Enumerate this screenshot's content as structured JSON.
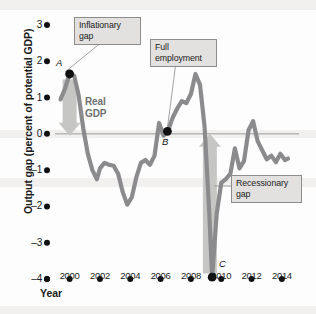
{
  "chart_data": {
    "type": "line",
    "title": "",
    "xlabel": "Year",
    "ylabel": "Output gap (percent of potential GDP)",
    "xlim": [
      1999.3,
      2014.6
    ],
    "ylim": [
      -4,
      3
    ],
    "grid": false,
    "zero_line": true,
    "legend": "none",
    "series_name": "Real GDP",
    "xticks": [
      2000,
      2002,
      2004,
      2006,
      2008,
      2010,
      2012,
      2014
    ],
    "xtick_labels": [
      "2000",
      "2002",
      "2004",
      "2006",
      "2008",
      "2010",
      "2012",
      "2014"
    ],
    "yticks": [
      3,
      2,
      1,
      0,
      -1,
      -2,
      -3,
      -4
    ],
    "ytick_labels": [
      "3",
      "2",
      "1",
      "0",
      "–1",
      "–2",
      "–3",
      "–4"
    ],
    "x": [
      1999.4,
      1999.7,
      2000.0,
      2000.3,
      2000.6,
      2000.9,
      2001.2,
      2001.5,
      2001.8,
      2002.0,
      2002.3,
      2002.6,
      2002.9,
      2003.2,
      2003.5,
      2003.8,
      2004.1,
      2004.4,
      2004.7,
      2005.0,
      2005.3,
      2005.6,
      2005.9,
      2006.2,
      2006.5,
      2006.8,
      2007.1,
      2007.4,
      2007.7,
      2008.0,
      2008.3,
      2008.6,
      2008.9,
      2009.2,
      2009.4,
      2009.7,
      2010.0,
      2010.3,
      2010.6,
      2010.9,
      2011.2,
      2011.5,
      2011.8,
      2012.1,
      2012.4,
      2012.7,
      2013.0,
      2013.3,
      2013.6,
      2013.9,
      2014.2,
      2014.4
    ],
    "y": [
      0.95,
      1.25,
      1.65,
      1.6,
      1.05,
      0.15,
      -0.55,
      -1.0,
      -1.25,
      -0.95,
      -0.8,
      -0.85,
      -0.88,
      -1.1,
      -1.6,
      -1.95,
      -1.75,
      -1.2,
      -0.8,
      -0.72,
      -0.85,
      -0.6,
      0.3,
      -0.05,
      0.1,
      0.45,
      0.7,
      0.9,
      0.85,
      1.1,
      1.65,
      1.35,
      0.2,
      -2.1,
      -3.95,
      -2.2,
      -1.35,
      -1.25,
      -1.1,
      -0.4,
      -0.95,
      -0.75,
      0.1,
      0.35,
      -0.2,
      -0.45,
      -0.7,
      -0.6,
      -0.78,
      -0.55,
      -0.72,
      -0.68
    ],
    "points": [
      {
        "label": "A",
        "x": 2000.0,
        "y": 1.65,
        "note": "Inflationary gap"
      },
      {
        "label": "B",
        "x": 2006.45,
        "y": 0.07,
        "note": "Full employment"
      },
      {
        "label": "C",
        "x": 2009.4,
        "y": -3.95,
        "note": "Recessionary gap"
      }
    ],
    "annotations": [
      {
        "name": "inflationary-gap",
        "text": "Inflationary\ngap",
        "line1": "Inflationary",
        "line2": "gap"
      },
      {
        "name": "full-employment",
        "text": "Full\nemployment",
        "line1": "Full",
        "line2": "employment"
      },
      {
        "name": "recessionary-gap",
        "text": "Recessionary\ngap",
        "line1": "Recessionary",
        "line2": "gap"
      }
    ],
    "arrows": [
      {
        "name": "inflationary-gap-arrow",
        "direction": "down",
        "x": 2000.0,
        "from": 1.5,
        "to": -0.05
      },
      {
        "name": "recessionary-gap-arrow",
        "direction": "up",
        "x": 2009.25,
        "from": -3.85,
        "to": 0.0
      }
    ],
    "colors": {
      "line": "#8b8b8e",
      "zero_line": "#9a9a9c",
      "arrow": "#c6c6c4",
      "callout_fill": "#e2e1df",
      "callout_border": "#8d8d8d",
      "text": "#1b1b1b",
      "series_label": "#6f6f70",
      "point": "#111111",
      "background": "#fdfdfd"
    }
  },
  "labels": {
    "series": {
      "line1": "Real",
      "line2": "GDP"
    },
    "point_a": "A",
    "point_b": "B",
    "point_c": "C",
    "xaxis": "Year",
    "yaxis": "Output gap (percent of potential GDP)"
  },
  "callouts": {
    "inflationary": {
      "line1": "Inflationary",
      "line2": "gap"
    },
    "full_employment": {
      "line1": "Full",
      "line2": "employment"
    },
    "recessionary": {
      "line1": "Recessionary",
      "line2": "gap"
    }
  }
}
